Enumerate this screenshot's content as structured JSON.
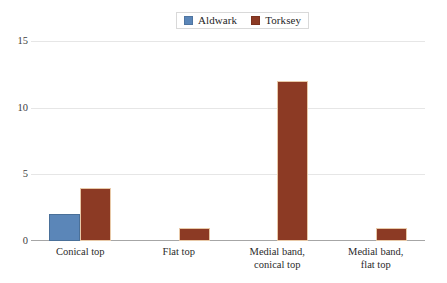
{
  "chart_data": {
    "type": "bar",
    "title": "",
    "subtitle": "",
    "xlabel": "",
    "ylabel": "",
    "categories": [
      "Conical top",
      "Flat top",
      "Medial band, conical top",
      "Medial band, flat top"
    ],
    "category_lines": [
      [
        "Conical top"
      ],
      [
        "Flat top"
      ],
      [
        "Medial band,",
        "conical top"
      ],
      [
        "Medial band,",
        "flat top"
      ]
    ],
    "series": [
      {
        "name": "Aldwark",
        "color": "#5b86b8",
        "values": [
          2,
          0,
          0,
          0
        ]
      },
      {
        "name": "Torksey",
        "color": "#8c3a24",
        "values": [
          4,
          1,
          12,
          1
        ]
      }
    ],
    "ylim": [
      0,
      15
    ],
    "yticks": [
      0,
      5,
      10,
      15
    ],
    "ytick_labels": [
      "0",
      "5",
      "10",
      "15"
    ],
    "grid": true,
    "legend_position": "top-center"
  },
  "legend": {
    "items": [
      {
        "label": "Aldwark",
        "color": "#5b86b8"
      },
      {
        "label": "Torksey",
        "color": "#8c3a24"
      }
    ]
  },
  "colors": {
    "aldwark": "#5b86b8",
    "torksey": "#8c3a24",
    "gridline": "#e6e6e6",
    "axis": "#a6a6a6",
    "text": "#2b2b2b",
    "background": "#ffffff"
  }
}
